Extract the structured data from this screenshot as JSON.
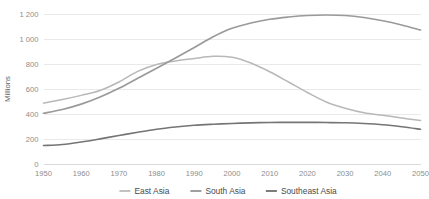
{
  "chart_data": {
    "type": "line",
    "title": "",
    "xlabel": "",
    "ylabel": "Millions",
    "xlim": [
      1950,
      2050
    ],
    "ylim": [
      0,
      1200
    ],
    "grid": true,
    "legend_position": "bottom",
    "x_tick_labels": [
      "1950",
      "1960",
      "1970",
      "1980",
      "1990",
      "2000",
      "2010",
      "2020",
      "2030",
      "2040",
      "2050"
    ],
    "x_ticks": [
      1950,
      1960,
      1970,
      1980,
      1990,
      2000,
      2010,
      2020,
      2030,
      2040,
      2050
    ],
    "y_tick_labels": [
      "0",
      "200",
      "400",
      "600",
      "800",
      "1 000",
      "1 200"
    ],
    "y_ticks": [
      0,
      200,
      400,
      600,
      800,
      1000,
      1200
    ],
    "x": [
      1950,
      1955,
      1960,
      1965,
      1970,
      1975,
      1980,
      1985,
      1990,
      1995,
      2000,
      2005,
      2010,
      2015,
      2020,
      2025,
      2030,
      2035,
      2040,
      2045,
      2050
    ],
    "series": [
      {
        "name": "East Asia",
        "color": "#b8b8b8",
        "width": 1.5,
        "values": [
          492,
          520,
          553,
          592,
          660,
          745,
          800,
          828,
          848,
          866,
          858,
          812,
          742,
          660,
          576,
          500,
          450,
          414,
          394,
          372,
          352
        ]
      },
      {
        "name": "South Asia",
        "color": "#9a9a9a",
        "width": 1.7,
        "values": [
          410,
          440,
          483,
          540,
          610,
          690,
          770,
          852,
          936,
          1022,
          1090,
          1132,
          1162,
          1180,
          1192,
          1196,
          1192,
          1176,
          1150,
          1116,
          1076
        ]
      },
      {
        "name": "Southeast Asia",
        "color": "#757575",
        "width": 1.7,
        "values": [
          152,
          160,
          180,
          205,
          232,
          258,
          282,
          300,
          314,
          322,
          328,
          333,
          336,
          337,
          337,
          336,
          334,
          328,
          318,
          302,
          282
        ]
      }
    ]
  },
  "legend": {
    "items": [
      {
        "label": "East Asia"
      },
      {
        "label": "South Asia"
      },
      {
        "label": "Southeast Asia"
      }
    ]
  },
  "axes": {
    "y_axis_title": "Millions"
  }
}
